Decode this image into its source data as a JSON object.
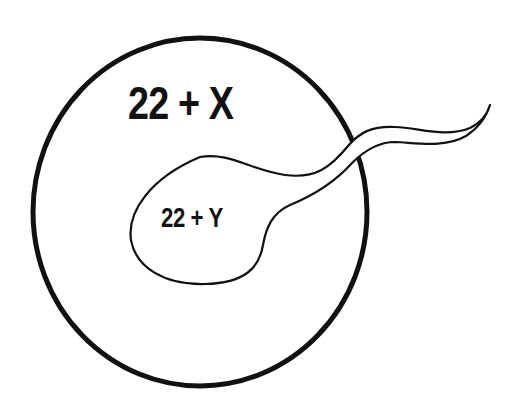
{
  "diagram": {
    "egg": {
      "label": "22 + X",
      "shape": "circle",
      "stroke": "#111111"
    },
    "sperm": {
      "label": "22 + Y",
      "shape": "head-with-tail",
      "stroke": "#111111"
    },
    "background": "#ffffff"
  }
}
